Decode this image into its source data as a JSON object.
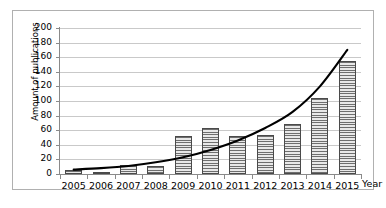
{
  "chart_data": {
    "type": "bar",
    "title": "",
    "xlabel": "Year",
    "ylabel": "Amount of publications",
    "categories": [
      "2005",
      "2006",
      "2007",
      "2008",
      "2009",
      "2010",
      "2011",
      "2012",
      "2013",
      "2014",
      "2015"
    ],
    "values": [
      5,
      3,
      13,
      11,
      52,
      63,
      52,
      54,
      68,
      104,
      155
    ],
    "series": [
      {
        "name": "Amount of publications",
        "type": "bar",
        "values": [
          5,
          3,
          13,
          11,
          52,
          63,
          52,
          54,
          68,
          104,
          155
        ]
      },
      {
        "name": "trend",
        "type": "line",
        "values": [
          6,
          8,
          11,
          16,
          23,
          33,
          46,
          63,
          85,
          120,
          170
        ]
      }
    ],
    "ylim": [
      0,
      200
    ],
    "yticks": [
      0,
      20,
      40,
      60,
      80,
      100,
      120,
      140,
      160,
      180,
      200
    ],
    "ytick_labels": [
      "0",
      "20",
      "40",
      "60",
      "80",
      "100",
      "120",
      "140",
      "160",
      "180",
      "200"
    ],
    "grid": true,
    "legend": "none",
    "colors": {
      "bar_fill": "#d2d2d2",
      "bar_hatch": "#6e6e6e",
      "bar_border": "#4a4a4a",
      "gridline": "#c9c9c9",
      "axis": "#8a8a8a",
      "trend_line": "#000000",
      "frame": "#b0b0b0",
      "background": "#ffffff"
    }
  }
}
